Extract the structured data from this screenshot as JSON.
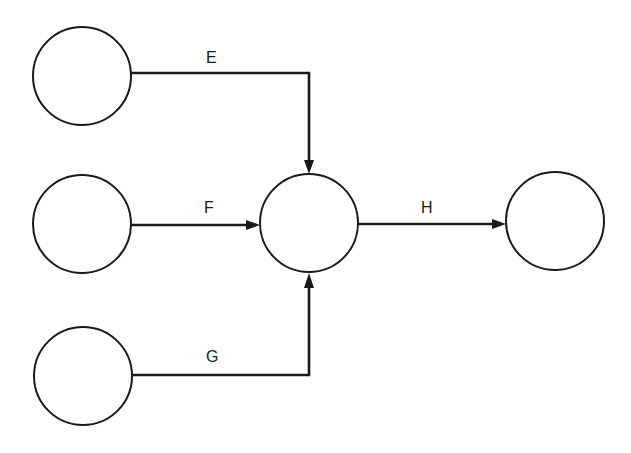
{
  "diagram": {
    "type": "activity-on-arrow network",
    "nodes": [
      {
        "id": "n1",
        "label": "",
        "cx": 82,
        "cy": 76,
        "r": 49
      },
      {
        "id": "n2",
        "label": "",
        "cx": 82,
        "cy": 224,
        "r": 49
      },
      {
        "id": "n3",
        "label": "",
        "cx": 83,
        "cy": 376,
        "r": 49
      },
      {
        "id": "n4",
        "label": "",
        "cx": 309,
        "cy": 223,
        "r": 49
      },
      {
        "id": "n5",
        "label": "",
        "cx": 555,
        "cy": 221,
        "r": 49
      }
    ],
    "edges": [
      {
        "id": "E",
        "label": "E",
        "from": "n1",
        "to": "n4"
      },
      {
        "id": "F",
        "label": "F",
        "from": "n2",
        "to": "n4"
      },
      {
        "id": "G",
        "label": "G",
        "from": "n3",
        "to": "n4"
      },
      {
        "id": "H",
        "label": "H",
        "from": "n4",
        "to": "n5"
      }
    ]
  }
}
